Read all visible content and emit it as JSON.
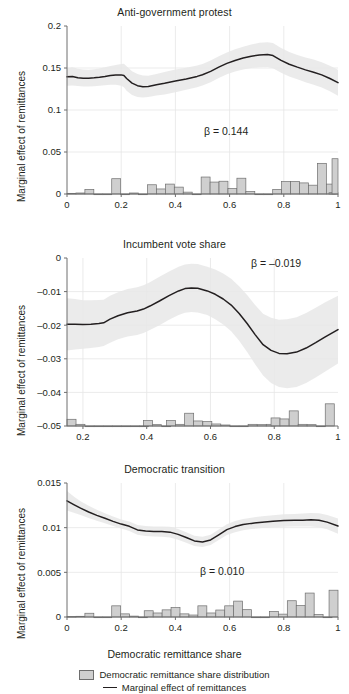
{
  "figure": {
    "width": 349,
    "height": 694,
    "background": "#ffffff",
    "line_color": "#231f20",
    "band_color": "#e8e8e8",
    "bar_fill": "#cfcfcf",
    "bar_stroke": "#6e6e6e",
    "axis_color": "#6e6e6e",
    "grid_color": "#e6e6e6"
  },
  "legend": {
    "position": "bottom-center",
    "entries": [
      {
        "label": "Democratic remittance share distribution",
        "marker": "bar-swatch"
      },
      {
        "label": "Marginal effect of remittances",
        "marker": "line-swatch"
      }
    ]
  },
  "chart_data": [
    {
      "type": "line",
      "title": "Anti-government protest",
      "xlabel": "",
      "ylabel": "Marginal effect of remittances",
      "annotation": "β = 0.144",
      "xlim": [
        0,
        1
      ],
      "ylim": [
        0,
        0.2
      ],
      "xticks": [
        0,
        0.2,
        0.4,
        0.6,
        0.8,
        1
      ],
      "xticklabels": [
        "0",
        "0.2",
        "0.4",
        "0.6",
        "0.8",
        "1"
      ],
      "yticks": [
        0,
        0.05,
        0.1,
        0.15,
        0.2
      ],
      "yticklabels": [
        "0",
        "0.05",
        "0.1",
        "0.15",
        "0.2"
      ],
      "grid": true,
      "series": [
        {
          "name": "Marginal effect of remittances",
          "x": [
            0.0,
            0.02,
            0.04,
            0.06,
            0.08,
            0.1,
            0.12,
            0.14,
            0.16,
            0.18,
            0.2,
            0.21,
            0.22,
            0.24,
            0.26,
            0.28,
            0.3,
            0.33,
            0.36,
            0.4,
            0.44,
            0.48,
            0.5,
            0.53,
            0.56,
            0.59,
            0.62,
            0.65,
            0.68,
            0.71,
            0.74,
            0.76,
            0.79,
            0.82,
            0.85,
            0.88,
            0.91,
            0.94,
            0.97,
            1.0
          ],
          "y": [
            0.1395,
            0.14,
            0.1385,
            0.1378,
            0.1378,
            0.1383,
            0.139,
            0.14,
            0.1412,
            0.1418,
            0.1418,
            0.141,
            0.1375,
            0.132,
            0.129,
            0.1278,
            0.128,
            0.13,
            0.1318,
            0.1345,
            0.137,
            0.14,
            0.142,
            0.146,
            0.151,
            0.1555,
            0.159,
            0.1618,
            0.164,
            0.1655,
            0.166,
            0.1648,
            0.159,
            0.1545,
            0.151,
            0.1478,
            0.145,
            0.1418,
            0.1375,
            0.1325
          ],
          "band_lower": [
            0.129,
            0.1292,
            0.1285,
            0.128,
            0.128,
            0.1282,
            0.1288,
            0.1296,
            0.1302,
            0.13,
            0.129,
            0.127,
            0.123,
            0.118,
            0.1155,
            0.115,
            0.1155,
            0.1172,
            0.1185,
            0.121,
            0.124,
            0.1272,
            0.1292,
            0.133,
            0.138,
            0.1425,
            0.1458,
            0.1482,
            0.15,
            0.151,
            0.1512,
            0.1498,
            0.1442,
            0.14,
            0.1365,
            0.133,
            0.13,
            0.1268,
            0.1222,
            0.117
          ],
          "band_upper": [
            0.15,
            0.1508,
            0.149,
            0.1482,
            0.148,
            0.1486,
            0.1495,
            0.1508,
            0.1524,
            0.1536,
            0.1548,
            0.1552,
            0.1522,
            0.1462,
            0.1428,
            0.141,
            0.1408,
            0.1428,
            0.1452,
            0.1482,
            0.1504,
            0.153,
            0.1548,
            0.159,
            0.164,
            0.1685,
            0.1722,
            0.1754,
            0.178,
            0.18,
            0.1808,
            0.1798,
            0.1738,
            0.169,
            0.1655,
            0.1626,
            0.16,
            0.1568,
            0.1528,
            0.148
          ]
        }
      ],
      "histogram": {
        "name": "Democratic remittance share distribution",
        "bin_width": 0.033,
        "bins": [
          {
            "x0": 0.0,
            "value": 0.0008
          },
          {
            "x0": 0.033,
            "value": 0.0012
          },
          {
            "x0": 0.066,
            "value": 0.0055
          },
          {
            "x0": 0.099,
            "value": 0.0
          },
          {
            "x0": 0.132,
            "value": 0.0
          },
          {
            "x0": 0.165,
            "value": 0.0182
          },
          {
            "x0": 0.198,
            "value": 0.0
          },
          {
            "x0": 0.231,
            "value": 0.0012
          },
          {
            "x0": 0.264,
            "value": 0.0
          },
          {
            "x0": 0.297,
            "value": 0.011
          },
          {
            "x0": 0.33,
            "value": 0.006
          },
          {
            "x0": 0.363,
            "value": 0.0118
          },
          {
            "x0": 0.396,
            "value": 0.0082
          },
          {
            "x0": 0.429,
            "value": 0.0022
          },
          {
            "x0": 0.462,
            "value": 0.0
          },
          {
            "x0": 0.495,
            "value": 0.0202
          },
          {
            "x0": 0.528,
            "value": 0.0142
          },
          {
            "x0": 0.561,
            "value": 0.0152
          },
          {
            "x0": 0.594,
            "value": 0.0065
          },
          {
            "x0": 0.627,
            "value": 0.0188
          },
          {
            "x0": 0.66,
            "value": 0.003
          },
          {
            "x0": 0.693,
            "value": 0.0
          },
          {
            "x0": 0.726,
            "value": 0.0
          },
          {
            "x0": 0.759,
            "value": 0.0055
          },
          {
            "x0": 0.792,
            "value": 0.0148
          },
          {
            "x0": 0.825,
            "value": 0.015
          },
          {
            "x0": 0.858,
            "value": 0.0132
          },
          {
            "x0": 0.891,
            "value": 0.0105
          },
          {
            "x0": 0.924,
            "value": 0.0365
          },
          {
            "x0": 0.957,
            "value": 0.0118
          },
          {
            "x0": 0.967,
            "value": 0.0015
          },
          {
            "x0": 0.978,
            "value": 0.042
          }
        ]
      }
    },
    {
      "type": "line",
      "title": "Incumbent vote share",
      "xlabel": "",
      "ylabel": "Marginal effect of remittances",
      "annotation": "β = –0.019",
      "xlim": [
        0.15,
        1
      ],
      "ylim": [
        -0.05,
        0
      ],
      "xticks": [
        0.2,
        0.4,
        0.6,
        0.8,
        1
      ],
      "xticklabels": [
        "0.2",
        "0.4",
        "0.6",
        "0.8",
        "1"
      ],
      "yticks": [
        -0.05,
        -0.04,
        -0.03,
        -0.02,
        -0.01,
        0
      ],
      "yticklabels": [
        "–0.05",
        "–0.04",
        "–0.03",
        "–0.02",
        "–0.01",
        "0"
      ],
      "grid": true,
      "series": [
        {
          "name": "Marginal effect of remittances",
          "x": [
            0.15,
            0.175,
            0.2,
            0.225,
            0.25,
            0.265,
            0.285,
            0.31,
            0.34,
            0.37,
            0.39,
            0.41,
            0.44,
            0.47,
            0.5,
            0.52,
            0.54,
            0.56,
            0.59,
            0.615,
            0.64,
            0.665,
            0.69,
            0.715,
            0.74,
            0.765,
            0.79,
            0.815,
            0.84,
            0.87,
            0.9,
            0.93,
            0.96,
            1.0
          ],
          "y": [
            -0.0197,
            -0.0197,
            -0.0198,
            -0.0197,
            -0.0195,
            -0.0193,
            -0.0182,
            -0.0172,
            -0.0163,
            -0.0158,
            -0.0152,
            -0.0143,
            -0.0128,
            -0.0112,
            -0.0098,
            -0.0091,
            -0.0089,
            -0.009,
            -0.0098,
            -0.0108,
            -0.0122,
            -0.014,
            -0.0165,
            -0.0195,
            -0.0228,
            -0.0258,
            -0.0275,
            -0.0284,
            -0.0285,
            -0.028,
            -0.0268,
            -0.0252,
            -0.0235,
            -0.0213
          ],
          "band_lower": [
            -0.0275,
            -0.0272,
            -0.027,
            -0.0268,
            -0.0265,
            -0.0262,
            -0.0252,
            -0.0242,
            -0.0234,
            -0.0229,
            -0.0223,
            -0.0214,
            -0.02,
            -0.0184,
            -0.017,
            -0.0163,
            -0.0161,
            -0.0162,
            -0.017,
            -0.0182,
            -0.0198,
            -0.0218,
            -0.0246,
            -0.028,
            -0.0316,
            -0.035,
            -0.0372,
            -0.0384,
            -0.0388,
            -0.0384,
            -0.0372,
            -0.0356,
            -0.0338,
            -0.0314
          ],
          "band_upper": [
            -0.012,
            -0.0122,
            -0.0126,
            -0.0126,
            -0.0125,
            -0.0124,
            -0.0112,
            -0.0102,
            -0.0092,
            -0.0087,
            -0.0081,
            -0.0072,
            -0.0056,
            -0.004,
            -0.0026,
            -0.0019,
            -0.0017,
            -0.0018,
            -0.0026,
            -0.0034,
            -0.0046,
            -0.0062,
            -0.0084,
            -0.011,
            -0.014,
            -0.0166,
            -0.0178,
            -0.0184,
            -0.0182,
            -0.0176,
            -0.0164,
            -0.0148,
            -0.0132,
            -0.0112
          ]
        }
      ],
      "histogram": {
        "name": "Democratic remittance share distribution",
        "baseline": -0.05,
        "bin_width": 0.0283,
        "bins": [
          {
            "x0": 0.15,
            "value": 0.002
          },
          {
            "x0": 0.178,
            "value": 0.0005
          },
          {
            "x0": 0.207,
            "value": 0.0
          },
          {
            "x0": 0.235,
            "value": 0.0
          },
          {
            "x0": 0.264,
            "value": 0.0
          },
          {
            "x0": 0.292,
            "value": 0.0
          },
          {
            "x0": 0.32,
            "value": 0.0
          },
          {
            "x0": 0.349,
            "value": 0.0
          },
          {
            "x0": 0.377,
            "value": 0.0
          },
          {
            "x0": 0.39,
            "value": 0.0016
          },
          {
            "x0": 0.418,
            "value": 0.0004
          },
          {
            "x0": 0.447,
            "value": 0.0
          },
          {
            "x0": 0.462,
            "value": 0.0016
          },
          {
            "x0": 0.49,
            "value": 0.0005
          },
          {
            "x0": 0.519,
            "value": 0.0038
          },
          {
            "x0": 0.547,
            "value": 0.0015
          },
          {
            "x0": 0.576,
            "value": 0.0013
          },
          {
            "x0": 0.604,
            "value": 0.0006
          },
          {
            "x0": 0.633,
            "value": 0.0003
          },
          {
            "x0": 0.661,
            "value": 0.0
          },
          {
            "x0": 0.69,
            "value": 0.0
          },
          {
            "x0": 0.718,
            "value": 0.0005
          },
          {
            "x0": 0.747,
            "value": 0.0004
          },
          {
            "x0": 0.775,
            "value": 0.0005
          },
          {
            "x0": 0.79,
            "value": 0.0024
          },
          {
            "x0": 0.818,
            "value": 0.0021
          },
          {
            "x0": 0.847,
            "value": 0.0045
          },
          {
            "x0": 0.875,
            "value": 0.0005
          },
          {
            "x0": 0.903,
            "value": 0.0004
          },
          {
            "x0": 0.932,
            "value": 0.0
          },
          {
            "x0": 0.96,
            "value": 0.0066
          }
        ]
      }
    },
    {
      "type": "line",
      "title": "Democratic transition",
      "xlabel": "Democratic remittance share",
      "ylabel": "Marginal effect of remittances",
      "annotation": "β = 0.010",
      "xlim": [
        0,
        1
      ],
      "ylim": [
        0,
        0.015
      ],
      "xticks": [
        0,
        0.2,
        0.4,
        0.6,
        0.8,
        1
      ],
      "xticklabels": [
        "0",
        "0.2",
        "0.4",
        "0.6",
        "0.8",
        "1"
      ],
      "yticks": [
        0,
        0.005,
        0.01,
        0.015
      ],
      "yticklabels": [
        "0",
        "0.005",
        "0.01",
        "0.015"
      ],
      "grid": true,
      "series": [
        {
          "name": "Marginal effect of remittances",
          "x": [
            0.0,
            0.025,
            0.05,
            0.08,
            0.11,
            0.14,
            0.17,
            0.2,
            0.23,
            0.26,
            0.29,
            0.32,
            0.35,
            0.38,
            0.41,
            0.44,
            0.47,
            0.5,
            0.53,
            0.56,
            0.59,
            0.62,
            0.65,
            0.68,
            0.72,
            0.76,
            0.8,
            0.84,
            0.87,
            0.9,
            0.93,
            0.96,
            1.0
          ],
          "y": [
            0.013,
            0.01258,
            0.01218,
            0.01175,
            0.01138,
            0.01105,
            0.0107,
            0.0104,
            0.01015,
            0.00975,
            0.00962,
            0.00958,
            0.00956,
            0.0095,
            0.00925,
            0.0089,
            0.00852,
            0.0084,
            0.00862,
            0.0092,
            0.00978,
            0.01012,
            0.01035,
            0.01048,
            0.01062,
            0.01072,
            0.0108,
            0.01082,
            0.01084,
            0.01088,
            0.01082,
            0.01062,
            0.01018
          ],
          "band_lower": [
            0.01192,
            0.01168,
            0.01142,
            0.01108,
            0.01078,
            0.0105,
            0.01018,
            0.0099,
            0.00962,
            0.00922,
            0.00908,
            0.00902,
            0.00898,
            0.0089,
            0.00865,
            0.00832,
            0.00796,
            0.00784,
            0.00806,
            0.00862,
            0.00918,
            0.0095,
            0.00972,
            0.00984,
            0.00996,
            0.01004,
            0.0101,
            0.01012,
            0.01012,
            0.01012,
            0.01004,
            0.00982,
            0.00932
          ],
          "band_upper": [
            0.0141,
            0.0135,
            0.01296,
            0.01244,
            0.012,
            0.01162,
            0.01124,
            0.01092,
            0.01068,
            0.0103,
            0.01018,
            0.01014,
            0.01014,
            0.0101,
            0.00986,
            0.0095,
            0.0091,
            0.00898,
            0.0092,
            0.0098,
            0.01038,
            0.01074,
            0.01098,
            0.01112,
            0.01128,
            0.0114,
            0.0115,
            0.01154,
            0.01158,
            0.01164,
            0.0116,
            0.01142,
            0.01104
          ]
        }
      ],
      "histogram": {
        "name": "Democratic remittance share distribution",
        "bin_width": 0.033,
        "bins": [
          {
            "x0": 0.0,
            "value": 6e-05
          },
          {
            "x0": 0.033,
            "value": 8e-05
          },
          {
            "x0": 0.066,
            "value": 0.00042
          },
          {
            "x0": 0.099,
            "value": 0.0
          },
          {
            "x0": 0.132,
            "value": 0.0
          },
          {
            "x0": 0.165,
            "value": 0.00125
          },
          {
            "x0": 0.198,
            "value": 0.00035
          },
          {
            "x0": 0.231,
            "value": 0.0001
          },
          {
            "x0": 0.264,
            "value": 0.0
          },
          {
            "x0": 0.285,
            "value": 0.0007
          },
          {
            "x0": 0.318,
            "value": 0.00045
          },
          {
            "x0": 0.351,
            "value": 0.0008
          },
          {
            "x0": 0.384,
            "value": 0.00105
          },
          {
            "x0": 0.417,
            "value": 0.00035
          },
          {
            "x0": 0.45,
            "value": 0.00022
          },
          {
            "x0": 0.483,
            "value": 0.00125
          },
          {
            "x0": 0.516,
            "value": 0.00045
          },
          {
            "x0": 0.549,
            "value": 0.00078
          },
          {
            "x0": 0.582,
            "value": 0.00125
          },
          {
            "x0": 0.615,
            "value": 0.00178
          },
          {
            "x0": 0.648,
            "value": 0.00082
          },
          {
            "x0": 0.681,
            "value": 0.0
          },
          {
            "x0": 0.714,
            "value": 0.0
          },
          {
            "x0": 0.747,
            "value": 0.00062
          },
          {
            "x0": 0.78,
            "value": 0.00032
          },
          {
            "x0": 0.813,
            "value": 0.00182
          },
          {
            "x0": 0.846,
            "value": 0.00128
          },
          {
            "x0": 0.879,
            "value": 0.00268
          },
          {
            "x0": 0.912,
            "value": 0.00028
          },
          {
            "x0": 0.945,
            "value": 0.0
          },
          {
            "x0": 0.967,
            "value": 0.003
          }
        ]
      }
    }
  ]
}
